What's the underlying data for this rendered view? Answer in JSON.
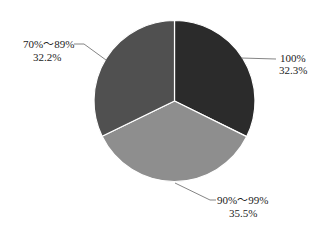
{
  "chart_data": {
    "type": "pie",
    "title": "",
    "categories": [
      "100%",
      "90%～99%",
      "70%～89%"
    ],
    "values": [
      32.3,
      35.5,
      32.2
    ],
    "value_labels": [
      "32.3%",
      "35.5%",
      "32.2%"
    ],
    "colors": [
      "#2b2b2b",
      "#8e8e8e",
      "#505050"
    ],
    "start_angle_deg": 0,
    "direction": "clockwise",
    "legend": "none",
    "labels_outside_with_leader_lines": true
  },
  "labels": {
    "slice_100": {
      "name": "100%",
      "value": "32.3%"
    },
    "slice_90_99": {
      "name": "90%～99%",
      "value": "35.5%"
    },
    "slice_70_89": {
      "name": "70%～89%",
      "value": "32.2%"
    }
  }
}
